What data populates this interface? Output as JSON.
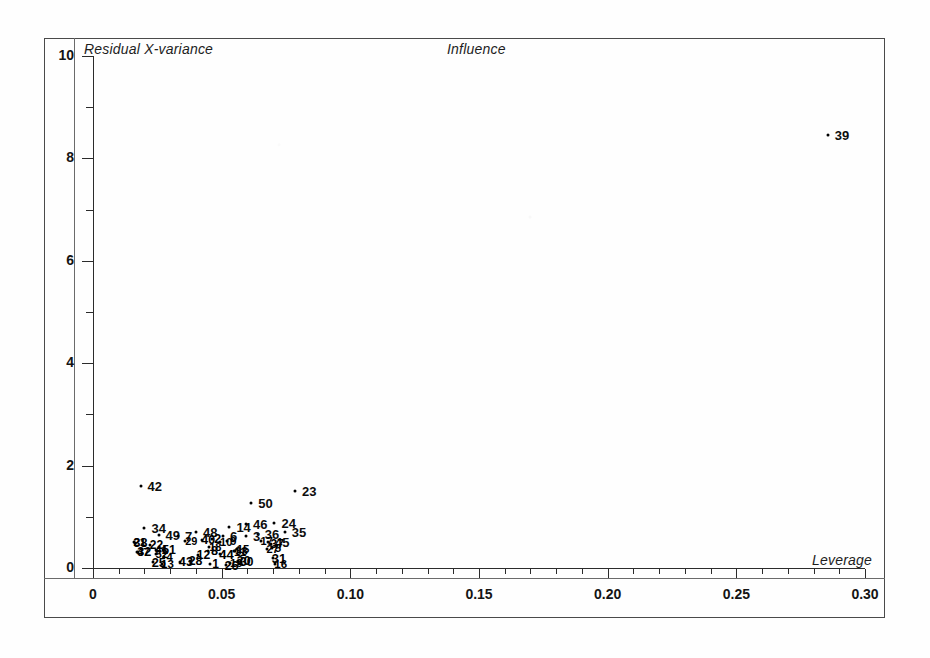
{
  "chart_data": {
    "type": "scatter",
    "title": "Influence",
    "xlabel": "Leverage",
    "ylabel": "Residual X-variance",
    "xlim": [
      0,
      0.3
    ],
    "ylim": [
      0,
      10
    ],
    "grid": false,
    "legend": null,
    "xticks": [
      "0",
      "0.05",
      "0.10",
      "0.15",
      "0.20",
      "0.25",
      "0.30"
    ],
    "xtick_values": [
      0,
      0.05,
      0.1,
      0.15,
      0.2,
      0.25,
      0.3
    ],
    "yticks": [
      "0",
      "2",
      "4",
      "6",
      "8",
      "10"
    ],
    "ytick_values": [
      0,
      2,
      4,
      6,
      8,
      10
    ],
    "y_minor_ticks": [
      1,
      3,
      5,
      7,
      9
    ],
    "x_minor_ticks": [
      0.01,
      0.02,
      0.03,
      0.04,
      0.06,
      0.07,
      0.08,
      0.09,
      0.11,
      0.12,
      0.13,
      0.14,
      0.16,
      0.17,
      0.18,
      0.19,
      0.21,
      0.22,
      0.23,
      0.24,
      0.26,
      0.27,
      0.28,
      0.29
    ],
    "point_color": "#000000",
    "labeled_points": [
      {
        "label": "39",
        "x": 0.2855,
        "y": 8.45
      },
      {
        "label": "42",
        "x": 0.0185,
        "y": 1.6
      },
      {
        "label": "23",
        "x": 0.0785,
        "y": 1.5
      },
      {
        "label": "50",
        "x": 0.0615,
        "y": 1.27
      },
      {
        "label": "34",
        "x": 0.02,
        "y": 0.79
      },
      {
        "label": "24",
        "x": 0.0705,
        "y": 0.88
      },
      {
        "label": "14",
        "x": 0.053,
        "y": 0.81
      },
      {
        "label": "46",
        "x": 0.0595,
        "y": 0.86
      },
      {
        "label": "35",
        "x": 0.0745,
        "y": 0.7
      },
      {
        "label": "36",
        "x": 0.064,
        "y": 0.66
      },
      {
        "label": "3",
        "x": 0.0595,
        "y": 0.63
      },
      {
        "label": "48",
        "x": 0.04,
        "y": 0.7
      },
      {
        "label": "49",
        "x": 0.0255,
        "y": 0.65
      },
      {
        "label": "45",
        "x": 0.068,
        "y": 0.5
      },
      {
        "label": "6",
        "x": 0.0505,
        "y": 0.62
      },
      {
        "label": "7",
        "x": 0.033,
        "y": 0.62
      }
    ],
    "dense_cluster_note": "Dozens of overlapping point labels form an illegible ink blob between leverage 0.018-0.075 at residual X-variance 0.05-0.55",
    "dense_cluster_labels": [
      "5",
      "8",
      "9",
      "10",
      "11",
      "12",
      "13",
      "15",
      "16",
      "17",
      "18",
      "19",
      "20",
      "21",
      "22",
      "25",
      "26",
      "27",
      "28",
      "29",
      "30",
      "31",
      "32",
      "33",
      "37",
      "38",
      "40",
      "41",
      "43",
      "44",
      "47",
      "1",
      "2",
      "4",
      "51",
      "52"
    ]
  },
  "figure": {
    "frame_visible": true,
    "axis_label_band_visible": true
  }
}
